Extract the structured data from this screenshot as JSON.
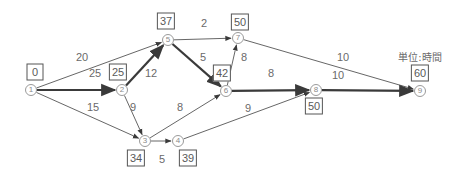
{
  "unit_label": "単位:時間",
  "nodes": [
    {
      "id": "1",
      "x": 31,
      "y": 90,
      "earliest": "0",
      "bx": 35,
      "by": 72
    },
    {
      "id": "2",
      "x": 122,
      "y": 90,
      "earliest": "25",
      "bx": 118,
      "by": 72
    },
    {
      "id": "3",
      "x": 145,
      "y": 141,
      "earliest": "34",
      "bx": 136,
      "by": 158
    },
    {
      "id": "4",
      "x": 178,
      "y": 141,
      "earliest": "39",
      "bx": 188,
      "by": 158
    },
    {
      "id": "5",
      "x": 168,
      "y": 40,
      "earliest": "37",
      "bx": 166,
      "by": 21
    },
    {
      "id": "6",
      "x": 226,
      "y": 91,
      "earliest": "42",
      "bx": 222,
      "by": 73
    },
    {
      "id": "7",
      "x": 238,
      "y": 38,
      "earliest": "50",
      "bx": 240,
      "by": 22
    },
    {
      "id": "8",
      "x": 316,
      "y": 90,
      "earliest": "50",
      "bx": 314,
      "by": 106
    },
    {
      "id": "9",
      "x": 420,
      "y": 91,
      "earliest": "60",
      "bx": 420,
      "by": 73
    }
  ],
  "edges": [
    {
      "from": "1",
      "to": "5",
      "duration": "20",
      "critical": false,
      "lx": 82,
      "ly": 57
    },
    {
      "from": "1",
      "to": "2",
      "duration": "25",
      "critical": true,
      "lx": 95,
      "ly": 73
    },
    {
      "from": "1",
      "to": "3",
      "duration": "15",
      "critical": false,
      "lx": 93,
      "ly": 107
    },
    {
      "from": "2",
      "to": "5",
      "duration": "12",
      "critical": true,
      "lx": 151,
      "ly": 73
    },
    {
      "from": "2",
      "to": "3",
      "duration": "9",
      "critical": false,
      "lx": 133,
      "ly": 107
    },
    {
      "from": "3",
      "to": "4",
      "duration": "5",
      "critical": false,
      "lx": 162,
      "ly": 159
    },
    {
      "from": "3",
      "to": "6",
      "duration": "8",
      "critical": false,
      "lx": 180,
      "ly": 107
    },
    {
      "from": "4",
      "to": "8",
      "duration": "9",
      "critical": false,
      "lx": 248,
      "ly": 108
    },
    {
      "from": "5",
      "to": "7",
      "duration": "2",
      "critical": false,
      "lx": 204,
      "ly": 23
    },
    {
      "from": "5",
      "to": "6",
      "duration": "5",
      "critical": true,
      "lx": 203,
      "ly": 57
    },
    {
      "from": "6",
      "to": "7",
      "duration": "8",
      "critical": false,
      "lx": 244,
      "ly": 57
    },
    {
      "from": "6",
      "to": "8",
      "duration": "8",
      "critical": true,
      "lx": 271,
      "ly": 73
    },
    {
      "from": "7",
      "to": "9",
      "duration": "10",
      "critical": false,
      "lx": 343,
      "ly": 57
    },
    {
      "from": "8",
      "to": "9",
      "duration": "10",
      "critical": true,
      "lx": 338,
      "ly": 75
    }
  ],
  "critical_path": [
    "1",
    "2",
    "5",
    "6",
    "8",
    "9"
  ],
  "colors": {
    "normal_edge": "#555555",
    "critical_edge": "#3a3a3a",
    "node_border": "#9a9a9a",
    "text": "#6a6a6a"
  }
}
